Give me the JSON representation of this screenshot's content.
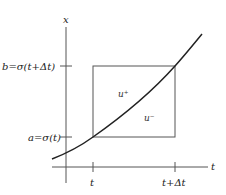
{
  "diagram": {
    "axes": {
      "vertical_label": "x",
      "horizontal_label": "t"
    },
    "x_ticks": [
      {
        "label": "t",
        "x": 93
      },
      {
        "label": "t+Δt",
        "x": 175
      }
    ],
    "y_ticks": [
      {
        "label": "b=σ(t+Δt)",
        "y": 66
      },
      {
        "label": "a=σ(t)",
        "y": 137
      }
    ],
    "regions": [
      {
        "label": "u⁺",
        "position": "above curve"
      },
      {
        "label": "u⁻",
        "position": "below curve"
      }
    ],
    "curve": {
      "description": "increasing convex curve x=σ(t)",
      "color": "#222222"
    },
    "box": {
      "from_t": "t",
      "to_t": "t+Δt",
      "from_x": "a",
      "to_x": "b"
    }
  }
}
